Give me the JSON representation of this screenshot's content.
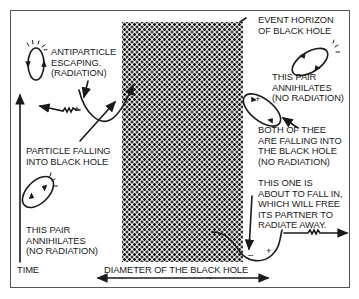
{
  "diagram": {
    "labels": {
      "event_horizon": "EVENT HORIZON\nOF BLACK HOLE",
      "antiparticle": "ANTIPARTICLE\nESCAPING.\n(RADIATION)",
      "pair_top_right": "THIS PAIR\nANNIHILATES\n(NO RADIATION)",
      "particle_falling": "PARTICLE FALLING\nINTO BLACK HOLE",
      "both_falling": "BOTH OF THEE\nARE FALLING INTO\nTHE BLACK HOLE\n(NO RADIATION)",
      "about_to_fall": "THIS ONE IS\nABOUT TO FALL IN,\nWHICH WILL FREE\nITS PARTNER TO\nRADIATE AWAY.",
      "pair_bottom_left": "THIS PAIR\nANNIHILATES\n(NO RADIATION)",
      "time_axis": "TIME",
      "diameter": "DIAMETER OF THE BLACK HOLE"
    },
    "signs": {
      "plus": "+",
      "minus": "–"
    },
    "colors": {
      "ink": "#1a1a1a",
      "frame": "#555555",
      "background": "#ffffff"
    }
  }
}
